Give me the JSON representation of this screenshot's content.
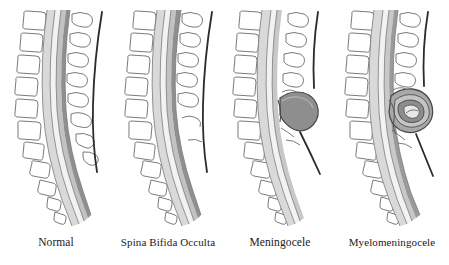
{
  "figure": {
    "background_color": "#ffffff",
    "panel_count": 4
  },
  "panels": [
    {
      "id": "normal",
      "label": "Normal",
      "description": "Normal spine with intact vertebrae, closed spinal canal and intact skin",
      "has_sac": false,
      "has_neural_tissue_in_sac": false,
      "spinous_processes_missing": false
    },
    {
      "id": "occulta",
      "label": "Spina Bifida Occulta",
      "description": "Vertebral arch defect in lower spine, no protruding sac, skin intact",
      "has_sac": false,
      "has_neural_tissue_in_sac": false,
      "spinous_processes_missing": true
    },
    {
      "id": "meningocele",
      "label": "Meningocele",
      "description": "Meninges protrude through vertebral defect forming a fluid-filled sac",
      "has_sac": true,
      "has_neural_tissue_in_sac": false,
      "spinous_processes_missing": true
    },
    {
      "id": "myelomeningocele",
      "label": "Myelomeningocele",
      "description": "Meninges and spinal cord tissue protrude through vertebral defect",
      "has_sac": true,
      "has_neural_tissue_in_sac": true,
      "spinous_processes_missing": true
    }
  ],
  "colors": {
    "outline": "#5a5a5a",
    "bone_fill": "#ffffff",
    "bone_outline": "#6b6b6b",
    "canal_outer": "#d9d9d9",
    "canal_middle": "#f2f2f2",
    "cord_dark": "#9a9a9a",
    "cord_darker": "#7d7d7d",
    "sac_fill": "#8e8e8e",
    "sac_outline": "#4a4a4a",
    "skin_line": "#2b2b2b",
    "label_text": "#1a1a1a"
  }
}
